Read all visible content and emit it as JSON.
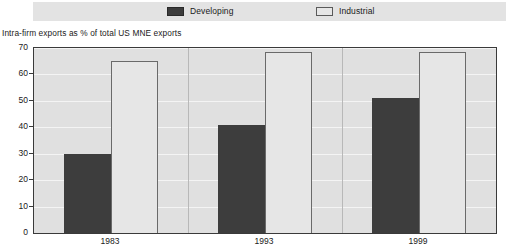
{
  "legend": {
    "items": [
      {
        "label": "Developing",
        "swatch": "dark-filled-swatch",
        "color": "#3d3d3d"
      },
      {
        "label": "Industrial",
        "swatch": "light-outlined-swatch",
        "color": "#e6e6e6"
      }
    ]
  },
  "chart_data": {
    "type": "bar",
    "title": "",
    "ylabel": "Intra-firm exports as % of total US MNE exports",
    "xlabel": "",
    "categories": [
      "1983",
      "1993",
      "1999"
    ],
    "series": [
      {
        "name": "Developing",
        "color": "#3d3d3d",
        "values": [
          30,
          41,
          51
        ]
      },
      {
        "name": "Industrial",
        "color": "#e6e6e6",
        "values": [
          65,
          68.5,
          68.5
        ]
      }
    ],
    "ylim": [
      0,
      70
    ],
    "yticks": [
      0,
      10,
      20,
      30,
      40,
      50,
      60,
      70
    ],
    "ytick_labels": [
      "0",
      "10",
      "20",
      "30",
      "40",
      "50",
      "60",
      "70"
    ],
    "grid": true,
    "legend_position": "top"
  }
}
